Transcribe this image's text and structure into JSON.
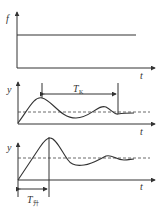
{
  "figure": {
    "panels": [
      {
        "id": "input",
        "y_label": "f",
        "x_label": "t",
        "description": "step input"
      },
      {
        "id": "response-1",
        "y_label": "y",
        "x_label": "t",
        "interval_label": "T",
        "interval_sub": "K"
      },
      {
        "id": "response-2",
        "y_label": "y",
        "x_label": "t",
        "interval_label": "T",
        "interval_sub": "升"
      }
    ]
  }
}
